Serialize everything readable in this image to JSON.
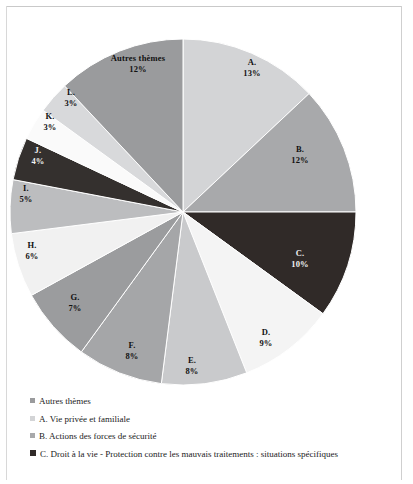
{
  "chart_data": {
    "type": "pie",
    "title": "",
    "start_angle_deg": 0,
    "direction": "clockwise",
    "center": {
      "x": 183,
      "y": 212
    },
    "radius": 173,
    "categories": [
      "A. Vie privée et familiale",
      "B. Actions des forces de sécurité",
      "C. Droit à la vie - Protection contre les mauvais traitements : situations spécifiques",
      "D.",
      "E.",
      "F.",
      "G.",
      "H.",
      "I.",
      "J.",
      "K.",
      "L.",
      "Autres thèmes"
    ],
    "values": [
      13,
      12,
      10,
      9,
      8,
      8,
      7,
      6,
      5,
      4,
      3,
      3,
      12
    ],
    "value_unit": "%",
    "slices": [
      {
        "key": "A",
        "label": "A.",
        "pct": "13%",
        "value": 13,
        "color": "#d3d4d6",
        "label_color": "dark",
        "label_x": 252,
        "label_y": 57
      },
      {
        "key": "B",
        "label": "B.",
        "pct": "12%",
        "value": 12,
        "color": "#a8a9ab",
        "label_color": "dark",
        "label_x": 300,
        "label_y": 144
      },
      {
        "key": "C",
        "label": "C.",
        "pct": "10%",
        "value": 10,
        "color": "#302a28",
        "label_color": "light",
        "label_x": 300,
        "label_y": 248
      },
      {
        "key": "D",
        "label": "D.",
        "pct": "9%",
        "value": 9,
        "color": "#f4f4f4",
        "label_color": "dark",
        "label_x": 266,
        "label_y": 327
      },
      {
        "key": "E",
        "label": "E.",
        "pct": "8%",
        "value": 8,
        "color": "#c9cacc",
        "label_color": "dark",
        "label_x": 192,
        "label_y": 355
      },
      {
        "key": "F",
        "label": "F.",
        "pct": "8%",
        "value": 8,
        "color": "#a5a6a8",
        "label_color": "dark",
        "label_x": 132,
        "label_y": 340
      },
      {
        "key": "G",
        "label": "G.",
        "pct": "7%",
        "value": 7,
        "color": "#9b9c9e",
        "label_color": "dark",
        "label_x": 75,
        "label_y": 292
      },
      {
        "key": "H",
        "label": "H.",
        "pct": "6%",
        "value": 6,
        "color": "#f1f1f1",
        "label_color": "dark",
        "label_x": 32,
        "label_y": 240
      },
      {
        "key": "I",
        "label": "I.",
        "pct": "5%",
        "value": 5,
        "color": "#bcbdbf",
        "label_color": "dark",
        "label_x": 26,
        "label_y": 183
      },
      {
        "key": "J",
        "label": "J.",
        "pct": "4%",
        "value": 4,
        "color": "#34302e",
        "label_color": "light",
        "label_x": 38,
        "label_y": 145
      },
      {
        "key": "K",
        "label": "K.",
        "pct": "3%",
        "value": 3,
        "color": "#fafafa",
        "label_color": "dark",
        "label_x": 50,
        "label_y": 111
      },
      {
        "key": "L",
        "label": "L.",
        "pct": "3%",
        "value": 3,
        "color": "#d8d9db",
        "label_color": "dark",
        "label_x": 71,
        "label_y": 87
      },
      {
        "key": "AUTRES",
        "label": "Autres thèmes",
        "pct": "12%",
        "value": 12,
        "color": "#9a9b9d",
        "label_color": "dark",
        "label_x": 138,
        "label_y": 53
      }
    ],
    "legend_position": "bottom",
    "legend": [
      {
        "label": "Autres thèmes",
        "color": "#9a9b9d",
        "size": 5
      },
      {
        "label": "A. Vie privée et familiale",
        "color": "#d3d4d6",
        "size": 5
      },
      {
        "label": "B. Actions des forces de sécurité",
        "color": "#a8a9ab",
        "size": 5
      },
      {
        "label": "C. Droit à la vie - Protection contre les mauvais traitements : situations spécifiques",
        "color": "#302a28",
        "size": 6
      }
    ]
  }
}
